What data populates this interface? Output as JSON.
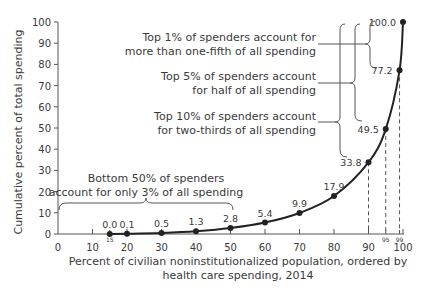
{
  "chart_data": {
    "type": "line",
    "title": "",
    "xlabel_line1": "Percent of civilian noninstitutionalized population, ordered by",
    "xlabel_line2": "health care spending, 2014",
    "ylabel": "Cumulative percent of total spending",
    "xlim": [
      0,
      100
    ],
    "ylim": [
      0,
      100
    ],
    "x_ticks": [
      0,
      10,
      20,
      30,
      40,
      50,
      60,
      70,
      80,
      90,
      100
    ],
    "x_minor_ticks": [
      15,
      95,
      99
    ],
    "y_ticks": [
      0,
      10,
      20,
      30,
      40,
      50,
      60,
      70,
      80,
      90,
      100
    ],
    "grid": false,
    "series": [
      {
        "name": "Cumulative spending",
        "x": [
          15,
          20,
          30,
          40,
          50,
          60,
          70,
          80,
          90,
          95,
          99,
          100
        ],
        "y": [
          0.0,
          0.1,
          0.5,
          1.3,
          2.8,
          5.4,
          9.9,
          17.9,
          33.8,
          49.5,
          77.2,
          100.0
        ],
        "labels": [
          "0.0",
          "0.1",
          "0.5",
          "1.3",
          "2.8",
          "5.4",
          "9.9",
          "17.9",
          "33.8",
          "49.5",
          "77.2",
          "100.0"
        ]
      }
    ],
    "annotations": [
      {
        "id": "top1",
        "line1": "Top 1% of spenders account for",
        "line2": "more than one-fifth of all spending"
      },
      {
        "id": "top5",
        "line1": "Top 5% of spenders account",
        "line2": "for half of all spending"
      },
      {
        "id": "top10",
        "line1": "Top 10% of spenders account",
        "line2": "for two-thirds of all spending"
      },
      {
        "id": "bottom50",
        "line1": "Bottom 50% of spenders",
        "line2": "account for only 3% of all spending"
      }
    ]
  }
}
